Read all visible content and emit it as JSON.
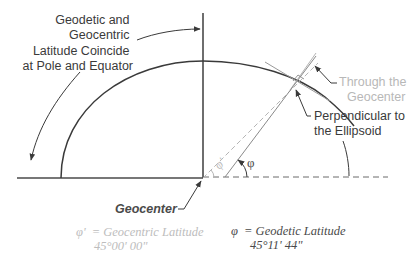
{
  "labels": {
    "coincide": [
      "Geodetic and",
      "Geocentric",
      "Latitude Coincide",
      "at Pole and Equator"
    ],
    "through": [
      "Through the",
      "Geocenter"
    ],
    "perpendicular": [
      "Perpendicular to",
      "the Ellipsoid"
    ],
    "geocenter": "Geocenter",
    "phi_symbol": "φ",
    "phi_prime_symbol": "φ'"
  },
  "legend": {
    "geocentric": {
      "symbol": "φ'",
      "text": "= Geocentric Latitude",
      "value": "45°00' 00\""
    },
    "geodetic": {
      "symbol": "φ",
      "text": "= Geodetic Latitude",
      "value": "45°11' 44\""
    }
  },
  "colors": {
    "line_dark": "#4a4a4a",
    "line_light": "#b5b5b5",
    "text_dark": "#3a3a3a",
    "text_light": "#b8b8b8"
  }
}
